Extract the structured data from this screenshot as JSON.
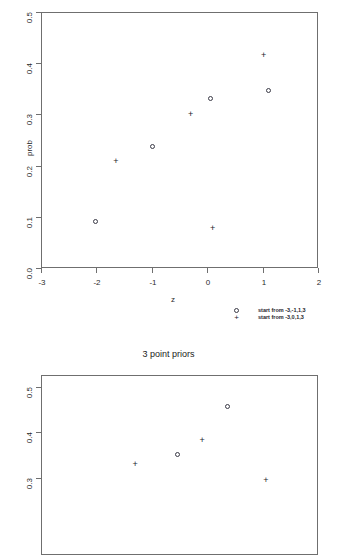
{
  "chart_data": [
    {
      "id": "top",
      "type": "scatter",
      "title": "",
      "xlabel": "z",
      "ylabel": "prob",
      "xlim": [
        -3.25,
        2.25
      ],
      "ylim": [
        -0.02,
        0.52
      ],
      "xticks": [
        "-3",
        "-2",
        "-1",
        "0",
        "1",
        "2"
      ],
      "xtickvalues": [
        -3,
        -2,
        -1,
        0,
        1,
        2
      ],
      "yticks": [
        "0.0",
        "0.1",
        "0.2",
        "0.3",
        "0.4",
        "0.5"
      ],
      "ytickvalues": [
        0.0,
        0.1,
        0.2,
        0.3,
        0.4,
        0.5
      ],
      "grid": false,
      "legend_position": "below-right",
      "series": [
        {
          "name": "start from -3,-1,1,3",
          "marker": "circle",
          "points": [
            {
              "x": -2.0,
              "y": 0.09
            },
            {
              "x": -0.97,
              "y": 0.236
            },
            {
              "x": 0.07,
              "y": 0.33
            },
            {
              "x": 1.12,
              "y": 0.345
            }
          ]
        },
        {
          "name": "start from -3,0,1,3",
          "marker": "plus",
          "points": [
            {
              "x": -1.65,
              "y": 0.208
            },
            {
              "x": -0.3,
              "y": 0.3
            },
            {
              "x": 0.1,
              "y": 0.078
            },
            {
              "x": 1.02,
              "y": 0.415
            }
          ]
        }
      ]
    },
    {
      "id": "bottom",
      "type": "scatter",
      "title": "3 point priors",
      "xlabel": "",
      "ylabel": "",
      "xlim": [
        -3.25,
        2.25
      ],
      "ylim": [
        0.27,
        0.52
      ],
      "xticks": [],
      "xtickvalues": [],
      "yticks": [
        "0.3",
        "0.4",
        "0.5"
      ],
      "ytickvalues": [
        0.3,
        0.4,
        0.5
      ],
      "grid": false,
      "cropped": true,
      "series": [
        {
          "name": "start from -3,-1,1,3",
          "marker": "circle",
          "points": [
            {
              "x": -0.52,
              "y": 0.35
            },
            {
              "x": 0.37,
              "y": 0.455
            }
          ]
        },
        {
          "name": "start from -3,0,1,3",
          "marker": "plus",
          "points": [
            {
              "x": -1.3,
              "y": 0.33
            },
            {
              "x": -0.09,
              "y": 0.382
            },
            {
              "x": 1.06,
              "y": 0.295
            }
          ]
        }
      ]
    }
  ],
  "top_panel": {
    "ylabel": "prob",
    "xlabel": "z",
    "yticks": [
      "0.0",
      "0.1",
      "0.2",
      "0.3",
      "0.4",
      "0.5"
    ],
    "xticks": [
      "-3",
      "-2",
      "-1",
      "0",
      "1",
      "2"
    ],
    "legend": [
      {
        "symbol": "circle",
        "label": "start from -3,-1,1,3"
      },
      {
        "symbol": "plus",
        "label": "start from -3,0,1,3"
      }
    ]
  },
  "bottom_panel": {
    "title": "3 point priors",
    "yticks": [
      "0.3",
      "0.4",
      "0.5"
    ]
  }
}
